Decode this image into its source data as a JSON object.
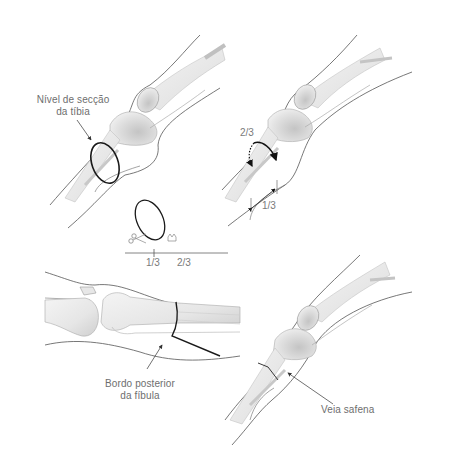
{
  "figure": {
    "panels": [
      {
        "id": "top-left",
        "labels": {
          "section_level_line1": "Nível de secção",
          "section_level_line2": "da tíbia"
        }
      },
      {
        "id": "top-right",
        "labels": {
          "fraction_top": "2/3",
          "fraction_bottom": "1/3"
        }
      },
      {
        "id": "center-inset",
        "labels": {
          "scale_left": "1/3",
          "scale_right": "2/3"
        },
        "icons": [
          "scissors-icon",
          "saw-icon"
        ]
      },
      {
        "id": "bottom-left",
        "labels": {
          "fibula_line1": "Bordo posterior",
          "fibula_line2": "da fíbula"
        }
      },
      {
        "id": "bottom-right",
        "labels": {
          "vein": "Veia safena"
        }
      }
    ],
    "colors": {
      "outline": "#555555",
      "bone_fill": "#e9e9e9",
      "bone_shade": "#c8c8c8",
      "incision": "#1a1a1a",
      "label_text": "#6e6e6e"
    }
  }
}
